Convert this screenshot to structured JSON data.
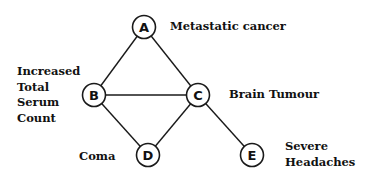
{
  "diagram": {
    "type": "bayesian-network",
    "nodes": [
      {
        "id": "A",
        "label": "Metastatic cancer",
        "x": 144,
        "y": 27
      },
      {
        "id": "B",
        "label": "Increased Total Serum Count",
        "x": 94,
        "y": 95
      },
      {
        "id": "C",
        "label": "Brain Tumour",
        "x": 198,
        "y": 95
      },
      {
        "id": "D",
        "label": "Coma",
        "x": 148,
        "y": 155
      },
      {
        "id": "E",
        "label": "Severe Headaches",
        "x": 252,
        "y": 155
      }
    ],
    "edges": [
      [
        "A",
        "B"
      ],
      [
        "A",
        "C"
      ],
      [
        "B",
        "C"
      ],
      [
        "B",
        "D"
      ],
      [
        "C",
        "D"
      ],
      [
        "C",
        "E"
      ]
    ],
    "labels": {
      "A": "Metastatic cancer",
      "B": [
        "Increased",
        "Total",
        "Serum",
        "Count"
      ],
      "C": "Brain Tumour",
      "D": "Coma",
      "E": [
        "Severe",
        "Headaches"
      ]
    }
  }
}
